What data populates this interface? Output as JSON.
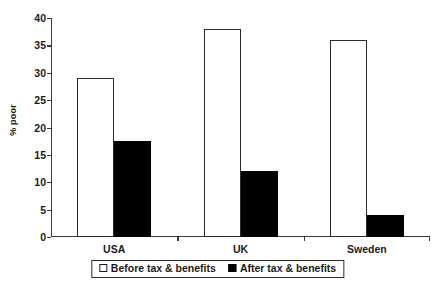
{
  "chart_data": {
    "type": "bar",
    "title": "",
    "subtitle": "",
    "xlabel": "",
    "ylabel": "% poor",
    "ylim": [
      0,
      40
    ],
    "yticks": [
      0,
      5,
      10,
      15,
      20,
      25,
      30,
      35,
      40
    ],
    "ytick_labels": [
      "0",
      "5",
      "10",
      "15",
      "20",
      "25",
      "30",
      "35",
      "40"
    ],
    "grid": false,
    "legend_position": "bottom-center",
    "categories": [
      "USA",
      "UK",
      "Sweden"
    ],
    "series": [
      {
        "name": "Before tax & benefits",
        "color": "#ffffff",
        "edge_color": "#2b2b2b",
        "values": [
          29,
          38,
          36
        ]
      },
      {
        "name": "After tax & benefits",
        "color": "#000000",
        "edge_color": "#000000",
        "values": [
          17.5,
          12,
          4
        ]
      }
    ]
  },
  "axis": {
    "line_color": "#3a3a3a"
  }
}
